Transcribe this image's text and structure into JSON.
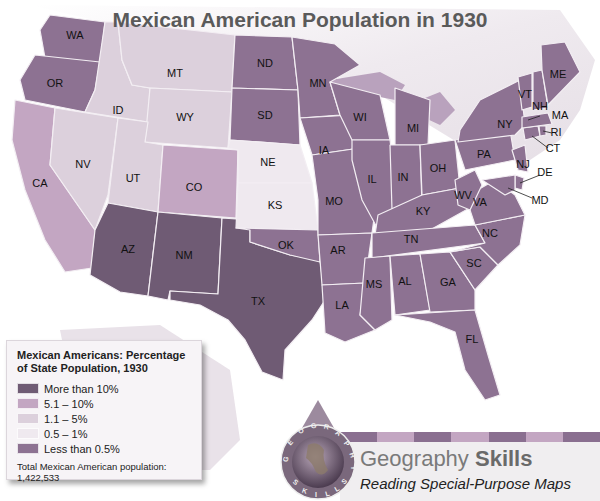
{
  "title": "Mexican American Population in 1930",
  "legend": {
    "title_line1": "Mexican Americans: Percentage",
    "title_line2": "of State Population, 1930",
    "items": [
      {
        "label": "More than 10%",
        "color": "#6f5b74"
      },
      {
        "label": "5.1 – 10%",
        "color": "#c3a6c2"
      },
      {
        "label": "1.1 – 5%",
        "color": "#dcd0dc"
      },
      {
        "label": "0.5 – 1%",
        "color": "#efe9ef"
      },
      {
        "label": "Less than 0.5%",
        "color": "#8d7292"
      }
    ],
    "total": "Total Mexican American population: 1,422,533"
  },
  "states": {
    "WA": {
      "label": "WA",
      "category": 4
    },
    "OR": {
      "label": "OR",
      "category": 4
    },
    "CA": {
      "label": "CA",
      "category": 1
    },
    "ID": {
      "label": "ID",
      "category": 2
    },
    "NV": {
      "label": "NV",
      "category": 2
    },
    "MT": {
      "label": "MT",
      "category": 2
    },
    "WY": {
      "label": "WY",
      "category": 2
    },
    "UT": {
      "label": "UT",
      "category": 2
    },
    "CO": {
      "label": "CO",
      "category": 1
    },
    "AZ": {
      "label": "AZ",
      "category": 0
    },
    "NM": {
      "label": "NM",
      "category": 0
    },
    "TX": {
      "label": "TX",
      "category": 0
    },
    "ND": {
      "label": "ND",
      "category": 4
    },
    "SD": {
      "label": "SD",
      "category": 4
    },
    "NE": {
      "label": "NE",
      "category": 3
    },
    "KS": {
      "label": "KS",
      "category": 3
    },
    "OK": {
      "label": "OK",
      "category": 4
    },
    "MN": {
      "label": "MN",
      "category": 4
    },
    "IA": {
      "label": "IA",
      "category": 4
    },
    "MO": {
      "label": "MO",
      "category": 4
    },
    "AR": {
      "label": "AR",
      "category": 4
    },
    "LA": {
      "label": "LA",
      "category": 4
    },
    "WI": {
      "label": "WI",
      "category": 4
    },
    "IL": {
      "label": "IL",
      "category": 4
    },
    "MI": {
      "label": "MI",
      "category": 4
    },
    "IN": {
      "label": "IN",
      "category": 4
    },
    "OH": {
      "label": "OH",
      "category": 4
    },
    "KY": {
      "label": "KY",
      "category": 4
    },
    "TN": {
      "label": "TN",
      "category": 4
    },
    "MS": {
      "label": "MS",
      "category": 4
    },
    "AL": {
      "label": "AL",
      "category": 4
    },
    "GA": {
      "label": "GA",
      "category": 4
    },
    "FL": {
      "label": "FL",
      "category": 4
    },
    "SC": {
      "label": "SC",
      "category": 4
    },
    "NC": {
      "label": "NC",
      "category": 4
    },
    "VA": {
      "label": "VA",
      "category": 4
    },
    "WV": {
      "label": "WV",
      "category": 4
    },
    "PA": {
      "label": "PA",
      "category": 4
    },
    "NY": {
      "label": "NY",
      "category": 4
    },
    "NJ": {
      "label": "NJ",
      "category": 4
    },
    "DE": {
      "label": "DE",
      "category": 4
    },
    "MD": {
      "label": "MD",
      "category": 4
    },
    "CT": {
      "label": "CT",
      "category": 4
    },
    "RI": {
      "label": "RI",
      "category": 4
    },
    "MA": {
      "label": "MA",
      "category": 4
    },
    "VT": {
      "label": "VT",
      "category": 4
    },
    "NH": {
      "label": "NH",
      "category": 4
    },
    "ME": {
      "label": "ME",
      "category": 4
    }
  },
  "badge": {
    "globe_text_top": "GEOGRAPHY",
    "globe_text_bottom": "SKILLS",
    "heading_regular": "Geography ",
    "heading_bold": "Skills",
    "subtitle": "Reading Special-Purpose Maps",
    "stripe_colors": [
      "#8a6f90",
      "#c3a6c2",
      "#8a6f90",
      "#c3a6c2",
      "#8a6f90",
      "#c3a6c2",
      "#8a6f90"
    ]
  }
}
